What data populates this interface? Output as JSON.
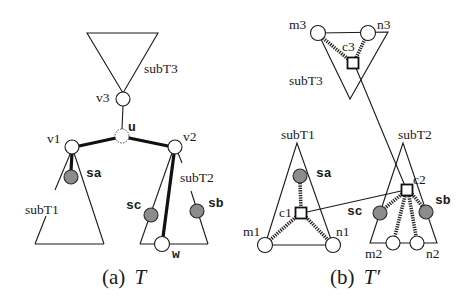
{
  "figure": {
    "panel_a": {
      "caption_prefix": "(a)",
      "caption_var": "T",
      "subtrees": {
        "subT1": "subT1",
        "subT2": "subT2",
        "subT3": "subT3"
      },
      "nodes": {
        "v1": "v1",
        "v2": "v2",
        "v3": "v3",
        "u": "u",
        "w": "w",
        "sa": "sa",
        "sb": "sb",
        "sc": "sc"
      }
    },
    "panel_b": {
      "caption_prefix": "(b)",
      "caption_var": "T′",
      "subtrees": {
        "subT1": "subT1",
        "subT2": "subT2",
        "subT3": "subT3"
      },
      "nodes": {
        "m1": "m1",
        "n1": "n1",
        "c1": "c1",
        "m2": "m2",
        "n2": "n2",
        "c2": "c2",
        "m3": "m3",
        "n3": "n3",
        "c3": "c3",
        "sa": "sa",
        "sb": "sb",
        "sc": "sc"
      }
    },
    "colors": {
      "line": "#111111",
      "special_node_fill": "#8c8c8c",
      "node_fill": "#ffffff",
      "background": "#ffffff"
    }
  }
}
